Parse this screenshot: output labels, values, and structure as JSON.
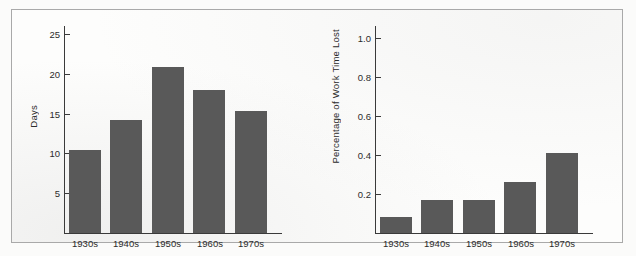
{
  "figure": {
    "background_color": "#fdfdfc",
    "frame_color": "#a9a9a9",
    "bar_color": "#595959",
    "axis_color": "#3a3a3a"
  },
  "chart_data": [
    {
      "type": "bar",
      "title": "",
      "xlabel": "",
      "ylabel": "Days",
      "categories": [
        "1930s",
        "1940s",
        "1950s",
        "1960s",
        "1970s"
      ],
      "values": [
        10.4,
        14.2,
        20.8,
        17.9,
        15.3
      ],
      "ylim": [
        0,
        26
      ],
      "yticks": [
        5,
        10,
        15,
        20,
        25
      ],
      "ytick_labels": [
        "5",
        "10",
        "15",
        "20",
        "25"
      ],
      "grid": false,
      "legend": "none"
    },
    {
      "type": "bar",
      "title": "",
      "xlabel": "",
      "ylabel": "Percentage of Work Time Lost",
      "categories": [
        "1930s",
        "1940s",
        "1950s",
        "1960s",
        "1970s"
      ],
      "values": [
        0.08,
        0.17,
        0.17,
        0.26,
        0.41
      ],
      "ylim": [
        0,
        1.06
      ],
      "yticks": [
        0.2,
        0.4,
        0.6,
        0.8,
        1.0
      ],
      "ytick_labels": [
        "0.2",
        "0.4",
        "0.6",
        "0.8",
        "1.0"
      ],
      "grid": false,
      "legend": "none"
    }
  ]
}
